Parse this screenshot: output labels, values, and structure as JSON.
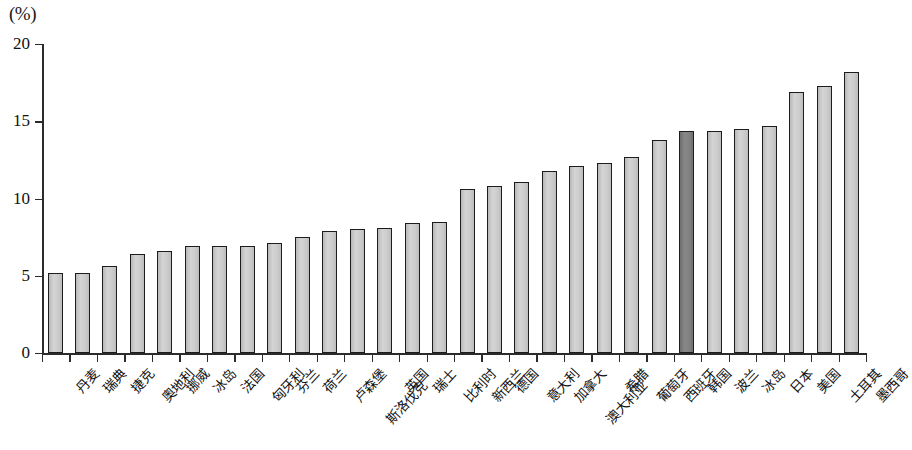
{
  "chart_data": {
    "type": "bar",
    "title": "",
    "subtitle": "",
    "xlabel": "",
    "ylabel": "(%)",
    "unit_label": "(%)",
    "ylim": [
      0,
      20
    ],
    "yticks": [
      0,
      5,
      10,
      15,
      20
    ],
    "ytick_labels": [
      "0",
      "5",
      "10",
      "15",
      "20"
    ],
    "grid": false,
    "legend": null,
    "highlight_category": "韩国",
    "highlight_color": "#7d7d7d",
    "bar_color": "#cacaca",
    "bar_border_color": "#1c1c1c",
    "axis_color": "#2b2b2b",
    "categories": [
      "丹麦",
      "瑞典",
      "捷克",
      "奧地利",
      "挪威",
      "冰岛",
      "法国",
      "匈牙利",
      "芬兰",
      "荷兰",
      "卢森堡",
      "斯洛伐克",
      "英国",
      "瑞士",
      "比利时",
      "新西兰",
      "德国",
      "意大利",
      "加拿大",
      "澳大利亚",
      "希腊",
      "葡萄牙",
      "西班牙",
      "韩国",
      "波兰",
      "冰岛",
      "日本",
      "美国",
      "土耳其",
      "墨西哥"
    ],
    "values": [
      5.2,
      5.2,
      5.6,
      6.4,
      6.6,
      6.9,
      6.9,
      6.9,
      7.1,
      7.5,
      7.9,
      8.0,
      8.1,
      8.4,
      8.5,
      10.6,
      10.8,
      11.1,
      11.8,
      12.1,
      12.3,
      12.7,
      13.8,
      14.4,
      14.4,
      14.5,
      14.7,
      16.9,
      17.3,
      18.2
    ]
  }
}
